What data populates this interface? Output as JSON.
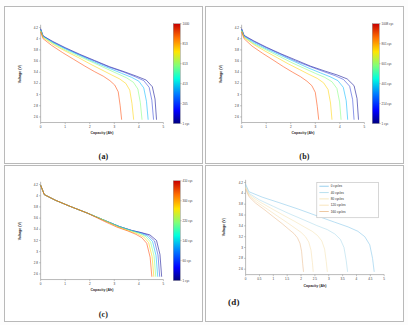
{
  "figure": {
    "layout": "2x2 grid of battery discharge voltage-capacity plots",
    "background_color": "#fdfdfd"
  },
  "panels": [
    {
      "id": "a",
      "caption": "(a)",
      "colorbar_labels": [
        "1000",
        "813",
        "613",
        "413",
        "205",
        "1 cyc"
      ],
      "colorbar_unit": "cyc"
    },
    {
      "id": "b",
      "caption": "(b)",
      "colorbar_labels": [
        "1008 cyc",
        "801 cyc",
        "601 cyc",
        "401 cyc",
        "214 cyc",
        "1 cyc"
      ],
      "colorbar_unit": "cyc"
    },
    {
      "id": "c",
      "caption": "(c)",
      "colorbar_labels": [
        "410 cyc",
        "300 cyc",
        "220 cyc",
        "140 cyc",
        "60 cyc",
        "1 cyc"
      ],
      "colorbar_unit": "cyc"
    },
    {
      "id": "d",
      "caption": "(d)",
      "legend": [
        "0 cycles",
        "40 cycles",
        "80 cycles",
        "120 cycles",
        "160 cycles"
      ]
    }
  ],
  "chart_data": [
    {
      "panel": "a",
      "type": "line",
      "title": "",
      "xlabel": "Capacity (Ah)",
      "ylabel": "Voltage (V)",
      "xlim": [
        0,
        5
      ],
      "ylim": [
        2.5,
        4.25
      ],
      "xticks": [
        0,
        1,
        2,
        3,
        4,
        5
      ],
      "yticks": [
        2.6,
        2.8,
        3,
        3.2,
        3.4,
        3.6,
        3.8,
        4,
        4.2
      ],
      "grid": false,
      "legend_position": "colorbar-right",
      "colormap": "jet",
      "series": [
        {
          "name": "1 cyc",
          "color": "#00008f",
          "x": [
            0,
            0.1,
            0.5,
            1.0,
            1.6,
            2.2,
            2.8,
            3.4,
            3.9,
            4.3,
            4.55,
            4.66,
            4.72
          ],
          "y": [
            4.18,
            4.05,
            3.95,
            3.84,
            3.72,
            3.61,
            3.5,
            3.41,
            3.33,
            3.26,
            3.14,
            2.92,
            2.55
          ]
        },
        {
          "name": "205 cyc",
          "color": "#2a3fd8",
          "x": [
            0,
            0.1,
            0.5,
            1.0,
            1.6,
            2.2,
            2.8,
            3.4,
            3.85,
            4.2,
            4.42,
            4.53,
            4.6
          ],
          "y": [
            4.17,
            4.05,
            3.94,
            3.83,
            3.71,
            3.6,
            3.49,
            3.4,
            3.32,
            3.25,
            3.13,
            2.9,
            2.55
          ]
        },
        {
          "name": "413 cyc",
          "color": "#00b7ff",
          "x": [
            0,
            0.1,
            0.5,
            1.0,
            1.6,
            2.2,
            2.8,
            3.3,
            3.7,
            4.0,
            4.2,
            4.31,
            4.38
          ],
          "y": [
            4.16,
            4.04,
            3.93,
            3.82,
            3.7,
            3.58,
            3.47,
            3.38,
            3.31,
            3.24,
            3.12,
            2.88,
            2.55
          ]
        },
        {
          "name": "613 cyc",
          "color": "#7fff79",
          "x": [
            0,
            0.1,
            0.5,
            1.0,
            1.6,
            2.2,
            2.7,
            3.15,
            3.5,
            3.78,
            3.96,
            4.06,
            4.13
          ],
          "y": [
            4.15,
            4.03,
            3.92,
            3.8,
            3.68,
            3.56,
            3.46,
            3.37,
            3.3,
            3.22,
            3.1,
            2.86,
            2.55
          ]
        },
        {
          "name": "813 cyc",
          "color": "#ffd300",
          "x": [
            0,
            0.1,
            0.5,
            1.0,
            1.55,
            2.05,
            2.5,
            2.9,
            3.22,
            3.47,
            3.63,
            3.72,
            3.79
          ],
          "y": [
            4.14,
            4.02,
            3.9,
            3.78,
            3.66,
            3.54,
            3.44,
            3.35,
            3.28,
            3.2,
            3.08,
            2.84,
            2.55
          ]
        },
        {
          "name": "1000 cyc",
          "color": "#ff4400",
          "x": [
            0,
            0.1,
            0.45,
            0.9,
            1.35,
            1.8,
            2.2,
            2.55,
            2.82,
            3.02,
            3.16,
            3.24,
            3.3
          ],
          "y": [
            4.12,
            4.0,
            3.88,
            3.75,
            3.63,
            3.51,
            3.41,
            3.33,
            3.25,
            3.17,
            3.05,
            2.8,
            2.55
          ]
        }
      ]
    },
    {
      "panel": "b",
      "type": "line",
      "title": "",
      "xlabel": "Capacity (Ah)",
      "ylabel": "Voltage (V)",
      "xlim": [
        0,
        5
      ],
      "ylim": [
        2.5,
        4.25
      ],
      "xticks": [
        0,
        1,
        2,
        3,
        4,
        5
      ],
      "yticks": [
        2.6,
        2.8,
        3,
        3.2,
        3.4,
        3.6,
        3.8,
        4,
        4.2
      ],
      "grid": false,
      "legend_position": "colorbar-right",
      "colormap": "jet",
      "series": [
        {
          "name": "1 cyc",
          "color": "#00008f",
          "x": [
            0,
            0.1,
            0.5,
            1.0,
            1.6,
            2.2,
            2.8,
            3.4,
            3.9,
            4.3,
            4.58,
            4.7,
            4.76
          ],
          "y": [
            4.18,
            4.06,
            3.96,
            3.85,
            3.73,
            3.62,
            3.51,
            3.42,
            3.35,
            3.28,
            3.16,
            2.93,
            2.55
          ]
        },
        {
          "name": "214 cyc",
          "color": "#2a3fd8",
          "x": [
            0,
            0.1,
            0.5,
            1.0,
            1.6,
            2.2,
            2.8,
            3.35,
            3.8,
            4.15,
            4.4,
            4.52,
            4.58
          ],
          "y": [
            4.17,
            4.05,
            3.95,
            3.84,
            3.72,
            3.6,
            3.5,
            3.41,
            3.34,
            3.27,
            3.15,
            2.91,
            2.55
          ]
        },
        {
          "name": "401 cyc",
          "color": "#00b7ff",
          "x": [
            0,
            0.1,
            0.5,
            1.0,
            1.6,
            2.15,
            2.7,
            3.2,
            3.6,
            3.92,
            4.14,
            4.26,
            4.32
          ],
          "y": [
            4.16,
            4.04,
            3.93,
            3.82,
            3.7,
            3.59,
            3.48,
            3.39,
            3.32,
            3.25,
            3.13,
            2.89,
            2.55
          ]
        },
        {
          "name": "601 cyc",
          "color": "#7fff79",
          "x": [
            0,
            0.1,
            0.5,
            1.0,
            1.55,
            2.05,
            2.55,
            3.0,
            3.38,
            3.68,
            3.88,
            3.99,
            4.05
          ],
          "y": [
            4.15,
            4.03,
            3.91,
            3.8,
            3.68,
            3.57,
            3.47,
            3.38,
            3.31,
            3.23,
            3.11,
            2.87,
            2.55
          ]
        },
        {
          "name": "801 cyc",
          "color": "#ffd300",
          "x": [
            0,
            0.1,
            0.48,
            0.95,
            1.45,
            1.9,
            2.35,
            2.75,
            3.08,
            3.34,
            3.52,
            3.62,
            3.68
          ],
          "y": [
            4.14,
            4.02,
            3.9,
            3.78,
            3.66,
            3.55,
            3.45,
            3.36,
            3.29,
            3.21,
            3.09,
            2.85,
            2.55
          ]
        },
        {
          "name": "1008 cyc",
          "color": "#ff4400",
          "x": [
            0,
            0.1,
            0.42,
            0.85,
            1.28,
            1.7,
            2.08,
            2.4,
            2.66,
            2.86,
            3.0,
            3.08,
            3.14
          ],
          "y": [
            4.12,
            4.0,
            3.87,
            3.74,
            3.62,
            3.5,
            3.4,
            3.32,
            3.24,
            3.16,
            3.04,
            2.79,
            2.55
          ]
        }
      ]
    },
    {
      "panel": "c",
      "type": "line",
      "title": "",
      "xlabel": "Capacity (Ah)",
      "ylabel": "Voltage (V)",
      "xlim": [
        0,
        5
      ],
      "ylim": [
        2.5,
        4.25
      ],
      "xticks": [
        0,
        1,
        2,
        3,
        4,
        5
      ],
      "yticks": [
        2.6,
        2.8,
        3,
        3.2,
        3.4,
        3.6,
        3.8,
        4,
        4.2
      ],
      "grid": false,
      "legend_position": "colorbar-right",
      "colormap": "jet",
      "note": "curves nearly overlapping, diverging only near end of discharge",
      "series": [
        {
          "name": "1 cyc",
          "color": "#00008f",
          "x": [
            0,
            0.15,
            0.6,
            1.2,
            1.9,
            2.6,
            3.2,
            3.7,
            4.1,
            4.45,
            4.72,
            4.86,
            4.93
          ],
          "y": [
            4.19,
            4.02,
            3.92,
            3.81,
            3.69,
            3.56,
            3.45,
            3.38,
            3.34,
            3.3,
            3.2,
            2.95,
            2.55
          ]
        },
        {
          "name": "60 cyc",
          "color": "#2a3fd8",
          "x": [
            0,
            0.15,
            0.6,
            1.2,
            1.9,
            2.6,
            3.2,
            3.7,
            4.08,
            4.4,
            4.64,
            4.78,
            4.85
          ],
          "y": [
            4.19,
            4.02,
            3.92,
            3.81,
            3.69,
            3.56,
            3.45,
            3.38,
            3.34,
            3.29,
            3.19,
            2.94,
            2.55
          ]
        },
        {
          "name": "140 cyc",
          "color": "#00b7ff",
          "x": [
            0,
            0.15,
            0.6,
            1.2,
            1.9,
            2.6,
            3.2,
            3.68,
            4.05,
            4.34,
            4.56,
            4.7,
            4.77
          ],
          "y": [
            4.19,
            4.02,
            3.92,
            3.81,
            3.69,
            3.56,
            3.45,
            3.38,
            3.33,
            3.28,
            3.18,
            2.93,
            2.55
          ]
        },
        {
          "name": "220 cyc",
          "color": "#7fff79",
          "x": [
            0,
            0.15,
            0.6,
            1.2,
            1.9,
            2.6,
            3.18,
            3.65,
            4.0,
            4.28,
            4.48,
            4.62,
            4.69
          ],
          "y": [
            4.19,
            4.02,
            3.92,
            3.81,
            3.69,
            3.56,
            3.45,
            3.38,
            3.33,
            3.27,
            3.17,
            2.92,
            2.55
          ]
        },
        {
          "name": "300 cyc",
          "color": "#ffd300",
          "x": [
            0,
            0.15,
            0.6,
            1.2,
            1.9,
            2.58,
            3.15,
            3.6,
            3.94,
            4.2,
            4.4,
            4.54,
            4.61
          ],
          "y": [
            4.19,
            4.02,
            3.92,
            3.81,
            3.69,
            3.56,
            3.44,
            3.37,
            3.32,
            3.26,
            3.16,
            2.91,
            2.55
          ]
        },
        {
          "name": "410 cyc",
          "color": "#ff4400",
          "x": [
            0,
            0.15,
            0.6,
            1.2,
            1.9,
            2.55,
            3.1,
            3.55,
            3.88,
            4.12,
            4.32,
            4.46,
            4.53
          ],
          "y": [
            4.19,
            4.02,
            3.92,
            3.81,
            3.69,
            3.55,
            3.44,
            3.37,
            3.31,
            3.25,
            3.15,
            2.9,
            2.55
          ]
        }
      ]
    },
    {
      "panel": "d",
      "type": "line",
      "title": "",
      "xlabel": "Capacity (Ah)",
      "ylabel": "Voltage (V)",
      "xlim": [
        0,
        5
      ],
      "ylim": [
        2.5,
        4.25
      ],
      "xticks": [
        0,
        0.5,
        1,
        1.5,
        2,
        2.5,
        3,
        3.5,
        4,
        4.5,
        5
      ],
      "yticks": [
        2.6,
        2.8,
        3,
        3.2,
        3.4,
        3.6,
        3.8,
        4,
        4.2
      ],
      "grid": false,
      "legend_position": "upper-right",
      "series": [
        {
          "name": "0 cycles",
          "color": "#7fc4e8",
          "x": [
            0,
            0.12,
            0.6,
            1.2,
            1.9,
            2.6,
            3.2,
            3.7,
            4.05,
            4.3,
            4.48,
            4.58,
            4.64
          ],
          "y": [
            4.17,
            4.03,
            3.93,
            3.83,
            3.71,
            3.58,
            3.47,
            3.38,
            3.3,
            3.2,
            3.05,
            2.8,
            2.55
          ]
        },
        {
          "name": "40 cycles",
          "color": "#a8d8ea",
          "x": [
            0,
            0.12,
            0.5,
            1.0,
            1.55,
            2.1,
            2.55,
            2.95,
            3.22,
            3.42,
            3.55,
            3.63,
            3.68
          ],
          "y": [
            4.14,
            4.0,
            3.88,
            3.76,
            3.63,
            3.51,
            3.41,
            3.33,
            3.25,
            3.15,
            3.0,
            2.76,
            2.55
          ]
        },
        {
          "name": "80 cycles",
          "color": "#f3e2b0",
          "x": [
            0,
            0.12,
            0.45,
            0.9,
            1.35,
            1.78,
            2.12,
            2.4,
            2.6,
            2.75,
            2.85,
            2.91,
            2.95
          ],
          "y": [
            4.12,
            3.98,
            3.86,
            3.73,
            3.6,
            3.48,
            3.38,
            3.3,
            3.22,
            3.12,
            2.97,
            2.74,
            2.55
          ]
        },
        {
          "name": "120 cycles",
          "color": "#f5deab",
          "x": [
            0,
            0.12,
            0.4,
            0.78,
            1.15,
            1.5,
            1.78,
            2.0,
            2.16,
            2.28,
            2.36,
            2.41,
            2.44
          ],
          "y": [
            4.1,
            3.96,
            3.84,
            3.71,
            3.58,
            3.46,
            3.36,
            3.28,
            3.2,
            3.1,
            2.95,
            2.72,
            2.55
          ]
        },
        {
          "name": "160 cycles",
          "color": "#e8b98a",
          "x": [
            0,
            0.12,
            0.36,
            0.7,
            1.02,
            1.32,
            1.55,
            1.74,
            1.87,
            1.96,
            2.02,
            2.06,
            2.09
          ],
          "y": [
            4.08,
            3.94,
            3.82,
            3.69,
            3.56,
            3.44,
            3.34,
            3.26,
            3.18,
            3.08,
            2.93,
            2.7,
            2.55
          ]
        }
      ]
    }
  ]
}
